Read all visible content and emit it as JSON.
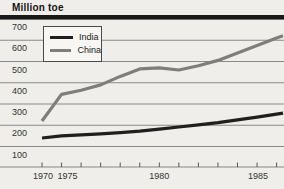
{
  "page": {
    "background": "#efeeea"
  },
  "chart_data": {
    "type": "line",
    "title": "Million toe",
    "x": [
      1970,
      1975,
      1976,
      1977,
      1978,
      1979,
      1980,
      1981,
      1982,
      1983,
      1984,
      1985,
      1986
    ],
    "x_axis_equal_tick_spacing": true,
    "x_tick_labels": [
      "1970",
      "1975",
      "1980",
      "1985"
    ],
    "series": [
      {
        "name": "India",
        "color": "#1f1f1f",
        "values": [
          140,
          150,
          155,
          160,
          165,
          172,
          182,
          192,
          202,
          212,
          225,
          238,
          252
        ]
      },
      {
        "name": "China",
        "color": "#7e7e7e",
        "values": [
          220,
          345,
          365,
          390,
          430,
          465,
          470,
          460,
          480,
          505,
          540,
          575,
          610
        ]
      }
    ],
    "ylim": [
      100,
      700
    ],
    "y_ticks": [
      700,
      600,
      500,
      400,
      300,
      200,
      100
    ],
    "grid": "horizontal",
    "legend_position": "top-left",
    "styles": {
      "top_rule_color": "#191919",
      "gridline_color": "#8a8a8a",
      "axis_color": "#888888",
      "tick_color": "#555555",
      "label_color": "#333333"
    }
  }
}
